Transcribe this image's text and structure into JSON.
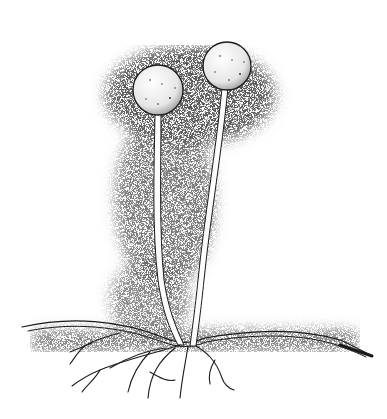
{
  "image": {
    "subject": "stippled pen illustration of bread mold (Rhizopus) with two sporangia on sporangiophores, stolon and rhizoids",
    "width": 387,
    "height": 419,
    "background": "#ffffff",
    "ink_color": "#1a1a1a",
    "elements": {
      "sporangia": [
        {
          "name": "left-sporangium",
          "cx": 158,
          "cy": 90,
          "r": 25
        },
        {
          "name": "right-sporangium",
          "cx": 227,
          "cy": 66,
          "r": 24
        }
      ],
      "stalks": [
        "left-stalk",
        "right-stalk"
      ],
      "stolon": "horizontal-stolon",
      "rhizoids": "root-like-rhizoids"
    }
  }
}
